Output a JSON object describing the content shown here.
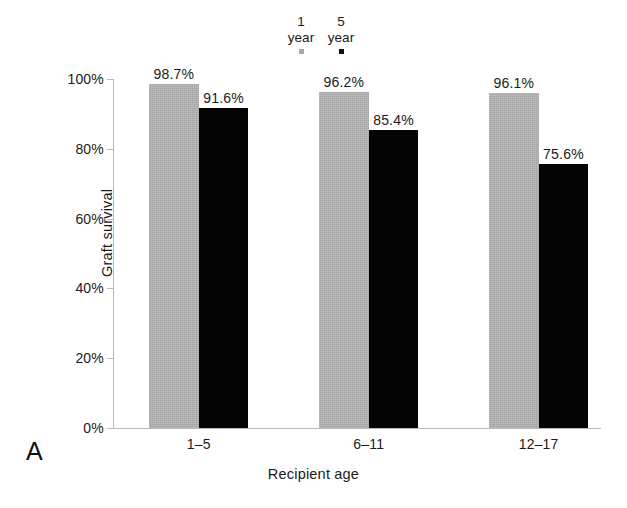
{
  "panel": {
    "label": "A"
  },
  "legend": {
    "position": "top-center",
    "entries": [
      {
        "num": "1",
        "unit": "year",
        "swatch": "gray",
        "color": "#a9a9a9"
      },
      {
        "num": "5",
        "unit": "year",
        "swatch": "black",
        "color": "#111111"
      }
    ]
  },
  "axes": {
    "ylabel": "Graft survival",
    "xlabel": "Recipient age",
    "yticks": [
      "0%",
      "20%",
      "40%",
      "60%",
      "80%",
      "100%"
    ],
    "ytick_values": [
      0,
      20,
      40,
      60,
      80,
      100
    ]
  },
  "colors": {
    "series_1_year": "#b4b4b4",
    "series_5_year": "#040404",
    "axis": "#b9b9b9",
    "text": "#1a1a1a",
    "background": "#ffffff"
  },
  "chart_data": {
    "type": "bar",
    "title": "",
    "subtitle": "",
    "xlabel": "Recipient age",
    "ylabel": "Graft survival",
    "categories": [
      "1–5",
      "6–11",
      "12–17"
    ],
    "series": [
      {
        "name": "1 year",
        "color": "#b4b4b4",
        "values": [
          98.7,
          96.2,
          96.1
        ],
        "labels": [
          "98.7%",
          "96.2%",
          "96.1%"
        ]
      },
      {
        "name": "5 year",
        "color": "#040404",
        "values": [
          91.6,
          85.4,
          75.6
        ],
        "labels": [
          "91.6%",
          "85.4%",
          "75.6%"
        ]
      }
    ],
    "ylim": [
      0,
      100
    ],
    "ytick_labels": [
      "0%",
      "20%",
      "40%",
      "60%",
      "80%",
      "100%"
    ],
    "grid": false,
    "legend_position": "top-center",
    "value_unit": "%"
  },
  "geometry": {
    "group_centers_pct": [
      17.6,
      52.5,
      87.4
    ],
    "bar_width_pct": 10.2
  }
}
